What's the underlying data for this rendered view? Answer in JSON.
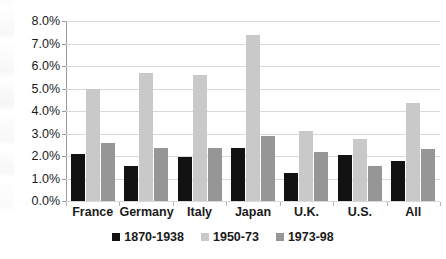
{
  "chart_data": {
    "type": "bar",
    "title": "",
    "xlabel": "",
    "ylabel": "",
    "ylim": [
      0,
      8
    ],
    "ytick_labels": [
      "0.0%",
      "1.0%",
      "2.0%",
      "3.0%",
      "4.0%",
      "5.0%",
      "6.0%",
      "7.0%",
      "8.0%"
    ],
    "ytick_values": [
      0,
      1,
      2,
      3,
      4,
      5,
      6,
      7,
      8
    ],
    "grid": "horizontal",
    "legend_position": "bottom-center",
    "categories": [
      "France",
      "Germany",
      "Italy",
      "Japan",
      "U.K.",
      "U.S.",
      "All"
    ],
    "series": [
      {
        "name": "1870-1938",
        "color": "#121212",
        "values": [
          2.1,
          1.55,
          1.95,
          2.35,
          1.25,
          2.05,
          1.8
        ]
      },
      {
        "name": "1950-73",
        "color": "#c9c9c9",
        "values": [
          5.0,
          5.7,
          5.6,
          7.4,
          3.1,
          2.75,
          4.35
        ]
      },
      {
        "name": "1973-98",
        "color": "#969696",
        "values": [
          2.6,
          2.35,
          2.35,
          2.9,
          2.2,
          1.55,
          2.3
        ]
      }
    ]
  }
}
